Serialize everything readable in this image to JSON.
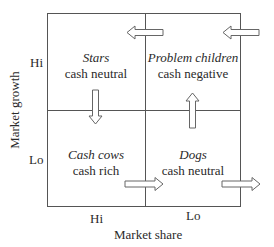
{
  "diagram": {
    "type": "BCG growth-share matrix",
    "y_axis": {
      "title": "Market growth",
      "ticks": [
        "Hi",
        "Lo"
      ]
    },
    "x_axis": {
      "title": "Market share",
      "ticks": [
        "Hi",
        "Lo"
      ]
    },
    "quadrants": [
      {
        "position": "top-left",
        "name": "Stars",
        "cash": "cash neutral"
      },
      {
        "position": "top-right",
        "name": "Problem children",
        "cash": "cash negative"
      },
      {
        "position": "bottom-left",
        "name": "Cash cows",
        "cash": "cash rich"
      },
      {
        "position": "bottom-right",
        "name": "Dogs",
        "cash": "cash neutral"
      }
    ],
    "arrows": [
      {
        "id": "into-stars",
        "direction": "left",
        "description": "from Problem children to Stars"
      },
      {
        "id": "into-problem-children",
        "direction": "left",
        "description": "entering Problem children from outside"
      },
      {
        "id": "stars-to-cash-cows",
        "direction": "down",
        "description": "from Stars to Cash cows"
      },
      {
        "id": "dogs-to-problem-children",
        "direction": "up",
        "description": "from Dogs to Problem children"
      },
      {
        "id": "cash-cows-to-dogs",
        "direction": "right",
        "description": "from Cash cows to Dogs"
      },
      {
        "id": "dogs-exit",
        "direction": "right",
        "description": "exiting from Dogs"
      }
    ],
    "colors": {
      "line": "#555555",
      "text": "#2a2a2a",
      "arrow_fill": "#ffffff"
    }
  }
}
